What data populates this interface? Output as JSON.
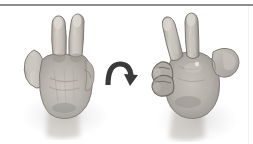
{
  "figure": {
    "caption": "",
    "background_color": "#ffffff",
    "width": 253,
    "height": 144,
    "rules": {
      "top_rule_color": "#8d8d8d",
      "right_rule_color": "#f2f2f2"
    }
  },
  "panels": [
    {
      "id": "left-hand",
      "label": "Hand gesture, palm-facing view",
      "description": "Grayscale photograph of a right hand held up showing a V / two-finger gesture with index and middle fingers extended, palm toward the viewer, thumb splayed to the left, ring and little fingers folded down.",
      "gesture": "two-finger V sign",
      "view": "palm view",
      "extended_fingers": 2,
      "skin_tone_hex": "#b9b4ad",
      "shadow_hex": "#8a867f"
    },
    {
      "id": "right-hand",
      "label": "Hand gesture, rotated side view",
      "description": "Grayscale photograph of the same hand rotated roughly ninety degrees, seen from the side and slightly behind, with index and middle fingers extended upward, the thumb projecting to the right and the folded fingers visible on the left.",
      "gesture": "two-finger V sign",
      "view": "rotated side view",
      "extended_fingers": 2,
      "skin_tone_hex": "#b7b2ab",
      "shadow_hex": "#878379"
    }
  ],
  "annotation": {
    "arrow": {
      "name": "rotation-arrow",
      "shape": "curved arc with arrowhead",
      "direction": "clockwise",
      "color_hex": "#3a3a3a",
      "meaning": "rotate the hand"
    }
  }
}
